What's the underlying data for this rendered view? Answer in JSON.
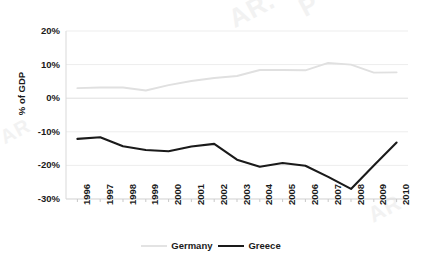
{
  "chart_data": {
    "type": "line",
    "title": "",
    "xlabel": "",
    "ylabel": "% of GDP",
    "categories": [
      "1996",
      "1997",
      "1998",
      "1999",
      "2000",
      "2001",
      "2002",
      "2003",
      "2004",
      "2005",
      "2006",
      "2007",
      "2008",
      "2009",
      "2010"
    ],
    "ylim": [
      -30,
      20
    ],
    "yticks": [
      20,
      10,
      0,
      -10,
      -20,
      -30
    ],
    "ytick_labels": [
      "20%",
      "10%",
      "0%",
      "-10%",
      "-20%",
      "-30%"
    ],
    "grid": true,
    "grid_axis": "y",
    "legend_position": "bottom",
    "series": [
      {
        "name": "Germany",
        "color": "#e0e0e0",
        "values": [
          3.0,
          3.2,
          3.2,
          2.3,
          3.9,
          5.1,
          6.0,
          6.6,
          8.4,
          8.4,
          8.3,
          10.5,
          10.0,
          7.6,
          7.7
        ]
      },
      {
        "name": "Greece",
        "color": "#1a1a1a",
        "values": [
          -12.1,
          -11.6,
          -14.3,
          -15.4,
          -15.8,
          -14.4,
          -13.6,
          -18.3,
          -20.4,
          -19.3,
          -20.1,
          -23.4,
          -27.0,
          -20.0,
          -13.2
        ]
      }
    ]
  },
  "legend": {
    "items": [
      {
        "label": "Germany"
      },
      {
        "label": "Greece"
      }
    ]
  },
  "axes": {
    "y_title": "% of GDP"
  },
  "watermark": {
    "fragments": [
      "AR.",
      "P",
      "AR",
      "AR"
    ]
  }
}
